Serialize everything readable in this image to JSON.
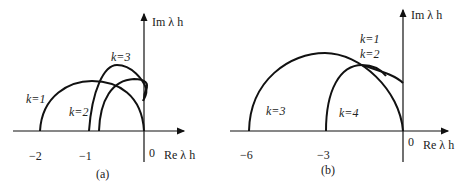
{
  "panels": [
    {
      "caption": "(a)",
      "x_axis_label": "Re λ h",
      "y_axis_label": "Im λ h",
      "x_ticks": [
        "−2",
        "−1",
        "0"
      ],
      "curve_labels": [
        "k=1",
        "k=2",
        "k=3"
      ]
    },
    {
      "caption": "(b)",
      "x_axis_label": "Re λ h",
      "y_axis_label": "Im λ h",
      "x_ticks": [
        "−6",
        "−3",
        "0"
      ],
      "curve_labels": [
        "k=1",
        "k=2",
        "k=3",
        "k=4"
      ]
    }
  ]
}
